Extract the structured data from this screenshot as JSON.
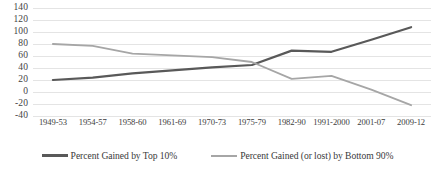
{
  "chart_data": {
    "type": "line",
    "title": "",
    "xlabel": "",
    "ylabel": "",
    "categories": [
      "1949-53",
      "1954-57",
      "1958-60",
      "1961-69",
      "1970-73",
      "1975-79",
      "1982-90",
      "1991-2000",
      "2001-07",
      "2009-12"
    ],
    "ylim": [
      -40,
      140
    ],
    "ytick_values": [
      140,
      120,
      100,
      80,
      60,
      40,
      20,
      0,
      -20,
      -40
    ],
    "ytick_labels": [
      "140",
      "120",
      "100",
      "80",
      "60",
      "40",
      "20",
      "0",
      "-20",
      "-40"
    ],
    "grid": true,
    "legend_position": "bottom",
    "series": [
      {
        "name": "Percent Gained by Top 10%",
        "color": "#595959",
        "values": [
          20,
          24,
          31,
          36,
          41,
          45,
          69,
          67,
          87,
          108
        ]
      },
      {
        "name": "Percent Gained (or lost) by Bottom 90%",
        "color": "#a6a6a6",
        "values": [
          80,
          77,
          64,
          61,
          58,
          50,
          22,
          27,
          4,
          -22
        ]
      }
    ]
  },
  "legend": {
    "items": [
      {
        "label": "Percent Gained by Top 10%",
        "swatch": "line-swatch-dark"
      },
      {
        "label": "Percent Gained (or lost) by Bottom 90%",
        "swatch": "line-swatch-light"
      }
    ]
  }
}
